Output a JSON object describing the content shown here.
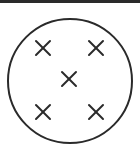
{
  "diagram": {
    "shape": "circle",
    "mark_symbol": "X",
    "mark_count": 5,
    "arrangement": "quincunx (dice five pattern)",
    "stroke_color": "#2a2a2a",
    "background_color": "#ffffff",
    "circle": {
      "cx": 70,
      "cy": 81,
      "r": 63
    },
    "marks": [
      {
        "id": "top-left",
        "cx": 43,
        "cy": 48
      },
      {
        "id": "top-right",
        "cx": 96,
        "cy": 48
      },
      {
        "id": "center",
        "cx": 69,
        "cy": 79
      },
      {
        "id": "bottom-left",
        "cx": 43,
        "cy": 112
      },
      {
        "id": "bottom-right",
        "cx": 96,
        "cy": 112
      }
    ]
  }
}
